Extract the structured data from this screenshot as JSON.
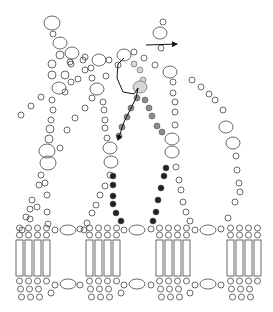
{
  "diagram": {
    "title": "",
    "width": 273,
    "height": 312,
    "colors": {
      "background": "#ffffff",
      "outline": "#444444",
      "highlight_light": "#d6d6d6",
      "highlight_mid": "#8c8c8c",
      "highlight_dark": "#222222",
      "arrow": "#111111"
    },
    "chains": [
      {
        "name": "chain-left-outer",
        "beads": [
          [
            52,
            23,
            8,
            7
          ],
          [
            53,
            34,
            3,
            3
          ],
          [
            60,
            43,
            7,
            6
          ],
          [
            72,
            53,
            7,
            6
          ],
          [
            60,
            55,
            4,
            4
          ],
          [
            52,
            64,
            4,
            4
          ],
          [
            71,
            64,
            3,
            3
          ],
          [
            52,
            75,
            4,
            4
          ],
          [
            65,
            75,
            4,
            4
          ],
          [
            59,
            88,
            7,
            6
          ],
          [
            52,
            100,
            3,
            3
          ],
          [
            53,
            110,
            3,
            3
          ],
          [
            51,
            120,
            3,
            3
          ],
          [
            50,
            129,
            4,
            4
          ],
          [
            49,
            139,
            4,
            4
          ],
          [
            47,
            151,
            8,
            7
          ],
          [
            48,
            163,
            8,
            7
          ],
          [
            41,
            175,
            3,
            3
          ],
          [
            45,
            183,
            3,
            3
          ],
          [
            39,
            185,
            3,
            3
          ],
          [
            47,
            195,
            3,
            3
          ],
          [
            32,
            200,
            3,
            3
          ],
          [
            30,
            209,
            3,
            3
          ],
          [
            26,
            217,
            3,
            3
          ],
          [
            47,
            212,
            3,
            3
          ],
          [
            48,
            224,
            3,
            3
          ]
        ]
      },
      {
        "name": "chain-left-branch",
        "beads": [
          [
            41,
            97,
            3,
            3
          ],
          [
            31,
            106,
            3,
            3
          ],
          [
            21,
            115,
            3,
            3
          ],
          [
            60,
            148,
            3,
            3
          ],
          [
            67,
            130,
            3,
            3
          ],
          [
            75,
            118,
            3,
            3
          ],
          [
            85,
            108,
            3,
            3
          ],
          [
            37,
            207,
            3,
            3
          ],
          [
            30,
            219,
            3,
            3
          ],
          [
            22,
            230,
            3,
            3
          ]
        ]
      },
      {
        "name": "chain-mid-left",
        "beads": [
          [
            85,
            57,
            3,
            3
          ],
          [
            99,
            60,
            7,
            6
          ],
          [
            91,
            68,
            3,
            3
          ],
          [
            109,
            60,
            3,
            3
          ],
          [
            92,
            78,
            3,
            3
          ],
          [
            106,
            76,
            3,
            3
          ],
          [
            97,
            89,
            7,
            6
          ],
          [
            92,
            98,
            3,
            3
          ],
          [
            103,
            102,
            3,
            3
          ],
          [
            104,
            110,
            3,
            3
          ],
          [
            105,
            120,
            3,
            3
          ],
          [
            105,
            128,
            3,
            3
          ],
          [
            107,
            138,
            3,
            3
          ],
          [
            110,
            148,
            7,
            6
          ],
          [
            111,
            162,
            7,
            6
          ],
          [
            110,
            175,
            3,
            3
          ],
          [
            105,
            186,
            3,
            3
          ],
          [
            100,
            195,
            3,
            3
          ],
          [
            96,
            205,
            3,
            3
          ],
          [
            92,
            213,
            3,
            3
          ],
          [
            87,
            223,
            3,
            3
          ],
          [
            84,
            230,
            3,
            3
          ]
        ]
      },
      {
        "name": "chain-center-right",
        "beads": [
          [
            118,
            65,
            3,
            3
          ],
          [
            124,
            55,
            7,
            6
          ],
          [
            134,
            52,
            3,
            3
          ],
          [
            144,
            58,
            3,
            3
          ],
          [
            155,
            65,
            3,
            3
          ],
          [
            161,
            48,
            3,
            3
          ],
          [
            160,
            33,
            7,
            6
          ],
          [
            163,
            22,
            3,
            3
          ],
          [
            170,
            72,
            7,
            6
          ],
          [
            173,
            82,
            3,
            3
          ],
          [
            173,
            93,
            3,
            3
          ],
          [
            175,
            102,
            3,
            3
          ],
          [
            175,
            112,
            3,
            3
          ],
          [
            175,
            125,
            3,
            3
          ],
          [
            172,
            139,
            7,
            6
          ],
          [
            172,
            152,
            7,
            6
          ],
          [
            176,
            167,
            3,
            3
          ],
          [
            179,
            180,
            3,
            3
          ],
          [
            181,
            190,
            3,
            3
          ],
          [
            183,
            202,
            3,
            3
          ],
          [
            186,
            212,
            3,
            3
          ],
          [
            190,
            221,
            3,
            3
          ]
        ]
      },
      {
        "name": "chain-right-outer",
        "beads": [
          [
            192,
            80,
            3,
            3
          ],
          [
            201,
            87,
            3,
            3
          ],
          [
            209,
            94,
            3,
            3
          ],
          [
            215,
            100,
            3,
            3
          ],
          [
            223,
            110,
            3,
            3
          ],
          [
            226,
            127,
            7,
            6
          ],
          [
            233,
            143,
            7,
            6
          ],
          [
            236,
            156,
            3,
            3
          ],
          [
            237,
            170,
            3,
            3
          ],
          [
            239,
            183,
            3,
            3
          ],
          [
            240,
            192,
            3,
            3
          ],
          [
            235,
            202,
            3,
            3
          ],
          [
            228,
            218,
            3,
            3
          ]
        ]
      },
      {
        "name": "chain-top-left",
        "beads": [
          [
            70,
            62,
            3,
            3
          ],
          [
            85,
            70,
            3,
            3
          ],
          [
            78,
            79,
            3,
            3
          ],
          [
            71,
            82,
            3,
            3
          ],
          [
            65,
            92,
            3,
            3
          ],
          [
            83,
            60,
            3,
            3
          ]
        ]
      }
    ],
    "highlighted": [
      {
        "shade": "light",
        "beads": [
          [
            134,
            64,
            3,
            3
          ],
          [
            140,
            70,
            3,
            3
          ],
          [
            143,
            80,
            3,
            3
          ],
          [
            140,
            87,
            7,
            6
          ]
        ]
      },
      {
        "shade": "mid",
        "beads": [
          [
            137,
            98,
            3,
            3
          ],
          [
            145,
            100,
            3,
            3
          ],
          [
            131,
            108,
            3,
            3
          ],
          [
            149,
            108,
            3,
            3
          ],
          [
            127,
            117,
            3,
            3
          ],
          [
            152,
            116,
            3,
            3
          ],
          [
            122,
            127,
            3,
            3
          ],
          [
            157,
            126,
            3,
            3
          ],
          [
            119,
            136,
            3,
            3
          ],
          [
            162,
            132,
            3,
            3
          ]
        ]
      },
      {
        "shade": "dark",
        "beads": [
          [
            113,
            176,
            3,
            3
          ],
          [
            113,
            185,
            3,
            3
          ],
          [
            113,
            196,
            3,
            3
          ],
          [
            113,
            204,
            3,
            3
          ],
          [
            116,
            213,
            3,
            3
          ],
          [
            121,
            221,
            3,
            3
          ],
          [
            166,
            168,
            3,
            3
          ],
          [
            164,
            176,
            3,
            3
          ],
          [
            161,
            188,
            3,
            3
          ],
          [
            158,
            200,
            3,
            3
          ],
          [
            156,
            212,
            3,
            3
          ],
          [
            153,
            221,
            3,
            3
          ]
        ]
      }
    ],
    "arrows": [
      {
        "name": "arrow-right",
        "from": [
          146,
          45
        ],
        "to": [
          177,
          44
        ]
      },
      {
        "name": "arrow-trace",
        "points": [
          [
            124,
            58
          ],
          [
            118,
            64
          ],
          [
            117,
            78
          ],
          [
            123,
            92
          ],
          [
            134,
            94
          ],
          [
            138,
            88
          ],
          [
            136,
            98
          ],
          [
            130,
            110
          ],
          [
            124,
            122
          ],
          [
            118,
            140
          ]
        ]
      }
    ],
    "membrane": {
      "units": [
        {
          "x": 16,
          "rects": 4
        },
        {
          "x": 86,
          "rects": 4
        },
        {
          "x": 156,
          "rects": 4
        },
        {
          "x": 227,
          "rects": 4
        }
      ],
      "rect_width": 7,
      "rect_gap": 2,
      "rect_top": 240,
      "rect_bottom": 276,
      "top_ellipses": [
        [
          68,
          230,
          8,
          5
        ],
        [
          137,
          230,
          8,
          5
        ],
        [
          208,
          230,
          8,
          5
        ]
      ],
      "bottom_ellipses": [
        [
          68,
          284,
          8,
          5
        ],
        [
          137,
          284,
          8,
          5
        ],
        [
          208,
          284,
          8,
          5
        ]
      ],
      "side_beads_top": [
        [
          55,
          230
        ],
        [
          80,
          229
        ],
        [
          124,
          230
        ],
        [
          151,
          229
        ],
        [
          195,
          230
        ],
        [
          221,
          229
        ]
      ],
      "side_beads_bottom": [
        [
          55,
          285
        ],
        [
          80,
          285
        ],
        [
          124,
          285
        ],
        [
          151,
          285
        ],
        [
          195,
          285
        ],
        [
          221,
          285
        ],
        [
          51,
          293
        ],
        [
          121,
          293
        ],
        [
          190,
          293
        ]
      ]
    }
  }
}
